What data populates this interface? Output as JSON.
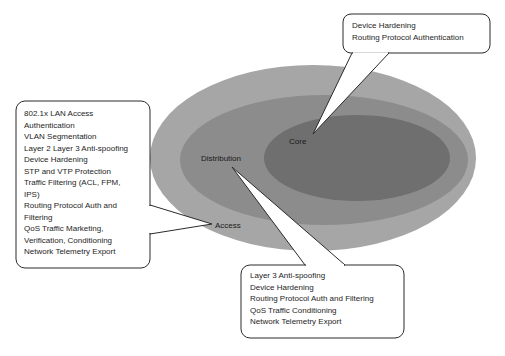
{
  "diagram": {
    "layers": [
      {
        "id": "access",
        "label": "Access",
        "color": "#a6a6a6",
        "features": [
          "802.1x LAN Access",
          "Authentication",
          "VLAN Segmentation",
          "Layer 2 Layer 3 Anti-spoofing",
          "Device Hardening",
          "STP and VTP Protection",
          "Traffic Filtering (ACL, FPM,",
          "IPS)",
          "Routing Protocol Auth and",
          "Filtering",
          "QoS Traffic Marketing,",
          "Verification, Conditioning",
          "Network Telemetry Export"
        ]
      },
      {
        "id": "distribution",
        "label": "Distribution",
        "color": "#8c8c8c",
        "features": [
          "Layer 3 Anti-spoofing",
          "Device Hardening",
          "Routing Protocol Auth and Filtering",
          "QoS Traffic Conditioning",
          "Network Telemetry Export"
        ]
      },
      {
        "id": "core",
        "label": "Core",
        "color": "#6f6f6f",
        "features": [
          "Device Hardening",
          "Routing Protocol Authentication"
        ]
      }
    ],
    "colors": {
      "background": "#ffffff",
      "callout_fill": "#ffffff",
      "callout_stroke": "#2a2a2a",
      "text": "#1e1e1e"
    }
  }
}
